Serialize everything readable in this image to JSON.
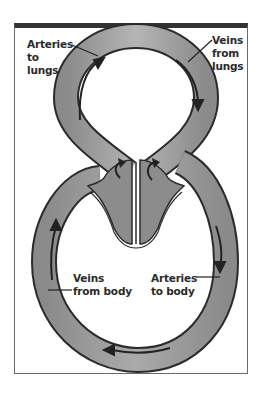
{
  "diagram": {
    "labels": {
      "arteries_to_lungs": [
        "Arteries",
        "to",
        "lungs"
      ],
      "veins_from_lungs": [
        "Veins",
        "from",
        "lungs"
      ],
      "veins_from_body": [
        "Veins",
        "from body"
      ],
      "arteries_to_body": [
        "Arteries",
        "to body"
      ]
    },
    "colors": {
      "vessel_fill": "#8f8f8f",
      "vessel_outline": "#2b2b2b",
      "heart_fill": "#8c8c8c",
      "frame_border": "#333333",
      "background": "#ffffff"
    }
  }
}
